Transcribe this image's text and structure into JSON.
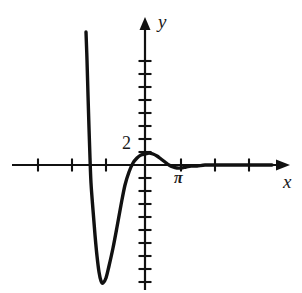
{
  "figure": {
    "kind": "cartesian-plot",
    "width": 302,
    "height": 293,
    "background_color": "#ffffff",
    "ink_color": "#111111"
  },
  "axes": {
    "x_label": "x",
    "y_label": "y",
    "x_axis_pixel_y": 165,
    "y_axis_pixel_x": 145,
    "x_axis_start_px": 12,
    "x_axis_end_px": 280,
    "y_axis_top_px": 22,
    "y_axis_bottom_px": 290,
    "x_tick_spacing_px": 34,
    "y_tick_spacing_px": 13,
    "x_ticks_px": [
      38,
      72,
      106,
      181,
      215,
      249
    ],
    "y_ticks_px": [
      61,
      74,
      87,
      100,
      113,
      126,
      139,
      152,
      178,
      191,
      204,
      217,
      230,
      243,
      256,
      269,
      282
    ],
    "arrowheads": [
      "x-positive",
      "y-positive"
    ]
  },
  "tick_labels": [
    {
      "text": "2",
      "axis": "y",
      "x_px": 122,
      "y_px": 134
    },
    {
      "text": "π",
      "axis": "x",
      "x_px": 174,
      "y_px": 170
    }
  ],
  "chart_data": {
    "type": "line",
    "title": "",
    "xlabel": "x",
    "ylabel": "y",
    "grid": false,
    "legend": null,
    "annotations": [
      "2",
      "π"
    ],
    "series": [
      {
        "name": "curve",
        "points_px": [
          [
            86,
            32
          ],
          [
            87,
            60
          ],
          [
            88,
            95
          ],
          [
            89,
            128
          ],
          [
            90,
            158
          ],
          [
            91,
            183
          ],
          [
            93,
            210
          ],
          [
            95,
            235
          ],
          [
            97,
            256
          ],
          [
            99,
            272
          ],
          [
            101,
            281
          ],
          [
            103,
            283
          ],
          [
            106,
            278
          ],
          [
            109,
            266
          ],
          [
            113,
            248
          ],
          [
            117,
            227
          ],
          [
            121,
            205
          ],
          [
            125,
            185
          ],
          [
            129,
            172
          ],
          [
            133,
            163
          ],
          [
            137,
            158
          ],
          [
            141,
            155
          ],
          [
            145,
            154
          ],
          [
            149,
            153
          ],
          [
            153,
            154
          ],
          [
            157,
            156
          ],
          [
            161,
            159
          ],
          [
            165,
            162
          ],
          [
            169,
            165
          ],
          [
            173,
            167
          ],
          [
            177,
            168
          ],
          [
            181,
            168
          ],
          [
            186,
            167
          ],
          [
            191,
            166
          ],
          [
            197,
            166
          ],
          [
            205,
            165
          ],
          [
            215,
            165
          ],
          [
            230,
            165
          ],
          [
            250,
            165
          ],
          [
            272,
            165
          ]
        ]
      }
    ],
    "features": {
      "local_minimum_px": [
        102,
        283
      ],
      "local_maximum_px": [
        149,
        153
      ],
      "local_maximum_value": 2,
      "x_axis_crossings_px": [
        133.5,
        168
      ],
      "asymptote": "y = 0 as x increases"
    }
  }
}
